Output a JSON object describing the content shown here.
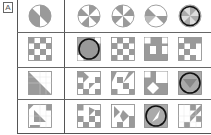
{
  "panel_label": "A",
  "colors": {
    "gray": "#9a9a9a",
    "line": "#555555",
    "grid": "#cccccc",
    "circle": "#111111"
  },
  "rows": [
    {
      "name": "wheel",
      "reference": "wheel-ref",
      "options": [
        "wheel-a",
        "wheel-b",
        "wheel-c",
        "wheel-d"
      ],
      "circled_index": 3
    },
    {
      "name": "checker",
      "reference": "checker-ref",
      "options": [
        "checker-a",
        "checker-b",
        "checker-c",
        "checker-d"
      ],
      "circled_index": 0
    },
    {
      "name": "triangle",
      "reference": "triangle-ref",
      "options": [
        "triangle-a",
        "triangle-b",
        "triangle-c",
        "triangle-d"
      ],
      "circled_index": 3
    },
    {
      "name": "complex",
      "reference": "complex-ref",
      "options": [
        "complex-a",
        "complex-b",
        "complex-c",
        "complex-d"
      ],
      "circled_index": 2
    }
  ]
}
